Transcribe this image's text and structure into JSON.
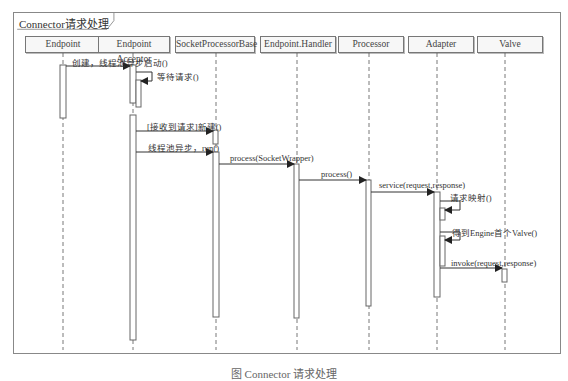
{
  "frame": {
    "title": "Connector请求处理"
  },
  "lifelines": [
    {
      "name": "Endpoint",
      "x": 63
    },
    {
      "name": "Endpoint Acceptor",
      "x": 133
    },
    {
      "name": "SocketProcessorBase",
      "x": 216
    },
    {
      "name": "Endpoint.Handler",
      "x": 297
    },
    {
      "name": "Processor",
      "x": 369
    },
    {
      "name": "Adapter",
      "x": 437
    },
    {
      "name": "Valve",
      "x": 505
    }
  ],
  "messages": [
    {
      "label": "创建，线程池异步启动()",
      "from": "Endpoint",
      "to": "Endpoint Acceptor"
    },
    {
      "label": "等待请求()",
      "from": "Endpoint Acceptor",
      "to": "Endpoint Acceptor",
      "self": true
    },
    {
      "label": "[接收到请求]新建()",
      "from": "Endpoint Acceptor",
      "to": "SocketProcessorBase"
    },
    {
      "label": "线程池异步，run()",
      "from": "Endpoint Acceptor",
      "to": "SocketProcessorBase"
    },
    {
      "label": "process(SocketWrapper)",
      "from": "SocketProcessorBase",
      "to": "Endpoint.Handler"
    },
    {
      "label": "process()",
      "from": "Endpoint.Handler",
      "to": "Processor"
    },
    {
      "label": "service(request,response)",
      "from": "Processor",
      "to": "Adapter"
    },
    {
      "label": "请求映射()",
      "from": "Adapter",
      "to": "Adapter",
      "self": true
    },
    {
      "label": "得到Engine首个Valve()",
      "from": "Adapter",
      "to": "Adapter",
      "self": true
    },
    {
      "label": "invoke(request,response)",
      "from": "Adapter",
      "to": "Valve"
    }
  ],
  "caption": "图 Connector 请求处理"
}
